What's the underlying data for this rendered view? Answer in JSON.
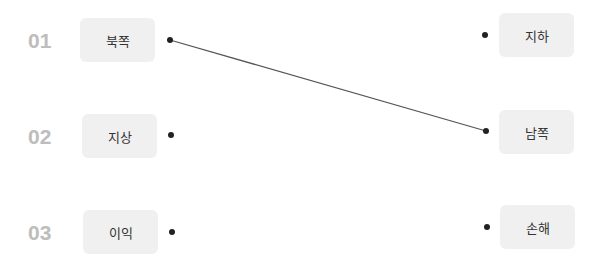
{
  "left_items": [
    {
      "number": "01",
      "label": "북쪽"
    },
    {
      "number": "02",
      "label": "지상"
    },
    {
      "number": "03",
      "label": "이익"
    }
  ],
  "right_items": [
    {
      "label": "지하"
    },
    {
      "label": "남쪽"
    },
    {
      "label": "손해"
    }
  ],
  "connections": [
    {
      "from": "북쪽",
      "to": "남쪽"
    }
  ],
  "colors": {
    "number": "#bdbdbd",
    "card_bg": "#f0f0f0",
    "line": "#555555",
    "dot": "#222222"
  }
}
